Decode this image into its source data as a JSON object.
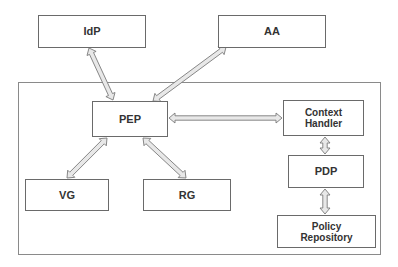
{
  "diagram": {
    "nodes": {
      "idp": "IdP",
      "aa": "AA",
      "pep": "PEP",
      "context_handler": "Context\nHandler",
      "pdp": "PDP",
      "vg": "VG",
      "rg": "RG",
      "policy_repository": "Policy\nRepository"
    },
    "edges": [
      {
        "from": "IdP",
        "to": "PEP",
        "direction": "bidirectional"
      },
      {
        "from": "AA",
        "to": "PEP",
        "direction": "bidirectional"
      },
      {
        "from": "PEP",
        "to": "Context Handler",
        "direction": "bidirectional"
      },
      {
        "from": "PEP",
        "to": "VG",
        "direction": "bidirectional"
      },
      {
        "from": "PEP",
        "to": "RG",
        "direction": "bidirectional"
      },
      {
        "from": "Context Handler",
        "to": "PDP",
        "direction": "bidirectional"
      },
      {
        "from": "PDP",
        "to": "Policy Repository",
        "direction": "bidirectional"
      }
    ],
    "colors": {
      "border": "#6a6a6a",
      "arrow_fill": "#e8e8e8",
      "arrow_stroke": "#7a7a7a"
    }
  }
}
